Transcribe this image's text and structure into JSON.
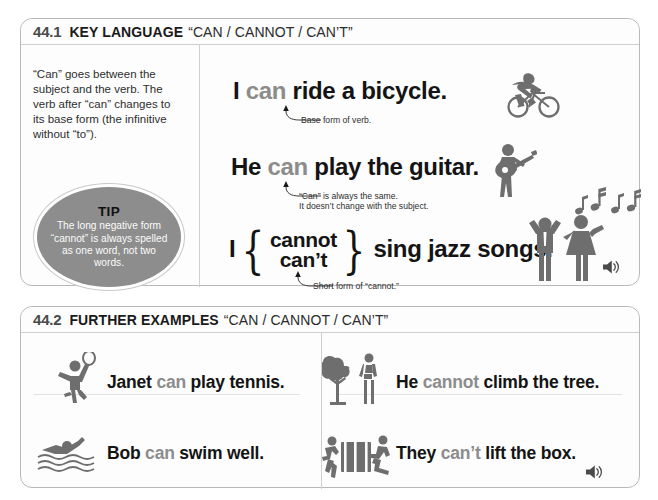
{
  "panels": [
    {
      "id": "key-language",
      "number": "44.1",
      "title": "KEY LANGUAGE",
      "quote": "“CAN / CANNOT / CAN’T”",
      "explanation": "“Can” goes between the subject and the verb. The verb after “can” changes to its base form (the infinitive without “to”).",
      "tip": {
        "label": "TIP",
        "body": "The long negative form “cannot” is always spelled as one word, not two words."
      },
      "examples": [
        {
          "pre": "I ",
          "keyword": "can",
          "post": " ride a bicycle.",
          "annotation": "Base form of verb.",
          "icon": "cyclist-icon"
        },
        {
          "pre": "He ",
          "keyword": "can",
          "post": " play the guitar.",
          "annotation_line1": "“Can” is always the same.",
          "annotation_line2": "It doesn’t change with the subject.",
          "icon": "guitarist-icon"
        },
        {
          "pre": "I",
          "brace_top": "cannot",
          "brace_bottom": "can’t",
          "post": "sing jazz songs.",
          "annotation": "Short form of “cannot.”",
          "icon": "singers-icon"
        }
      ],
      "audio_label": "speaker-icon"
    },
    {
      "id": "further-examples",
      "number": "44.2",
      "title": "FURTHER EXAMPLES",
      "quote": "“CAN / CANNOT / CAN’T”",
      "examples": [
        {
          "pre": "Janet ",
          "keyword": "can",
          "post": " play tennis.",
          "icon": "tennis-player-icon"
        },
        {
          "pre": "Bob ",
          "keyword": "can",
          "post": " swim well.",
          "icon": "swimmer-icon"
        },
        {
          "pre": "He ",
          "keyword": "cannot",
          "post": " climb the tree.",
          "icon": "tree-and-person-icon"
        },
        {
          "pre": "They ",
          "keyword": "can’t",
          "post": " lift the box.",
          "icon": "people-lifting-box-icon"
        }
      ],
      "audio_label": "speaker-icon"
    }
  ],
  "colors": {
    "keyword_gray": "#8c8c8c",
    "text_black": "#141414",
    "tip_circle": "#8d8d8d",
    "panel_border": "#b9b9b9",
    "icon_gray": "#6e6e6e"
  }
}
